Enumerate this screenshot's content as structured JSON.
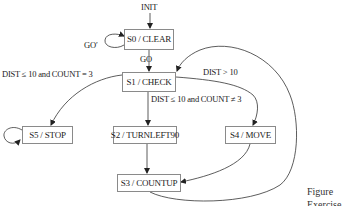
{
  "diagram": {
    "type": "state-machine",
    "initial_label": "INIT",
    "states": [
      {
        "id": "S0",
        "label": "S0 / CLEAR"
      },
      {
        "id": "S1",
        "label": "S1 / CHECK"
      },
      {
        "id": "S2",
        "label": "S2 / TURNLEFT90"
      },
      {
        "id": "S3",
        "label": "S3 / COUNTUP"
      },
      {
        "id": "S4",
        "label": "S4 / MOVE"
      },
      {
        "id": "S5",
        "label": "S5 / STOP"
      }
    ],
    "transitions": [
      {
        "from": "INIT",
        "to": "S0",
        "label": ""
      },
      {
        "from": "S0",
        "to": "S0",
        "label": "GO′"
      },
      {
        "from": "S0",
        "to": "S1",
        "label": "GO"
      },
      {
        "from": "S1",
        "to": "S5",
        "label": "DIST ≤ 10 and COUNT = 3"
      },
      {
        "from": "S1",
        "to": "S2",
        "label": "DIST ≤ 10 and COUNT ≠ 3"
      },
      {
        "from": "S1",
        "to": "S4",
        "label": "DIST > 10"
      },
      {
        "from": "S2",
        "to": "S3",
        "label": ""
      },
      {
        "from": "S4",
        "to": "S3",
        "label": ""
      },
      {
        "from": "S3",
        "to": "S1",
        "label": ""
      },
      {
        "from": "S5",
        "to": "S5",
        "label": ""
      }
    ],
    "caption": {
      "line1": "Figure",
      "line2": "Exercise"
    }
  }
}
